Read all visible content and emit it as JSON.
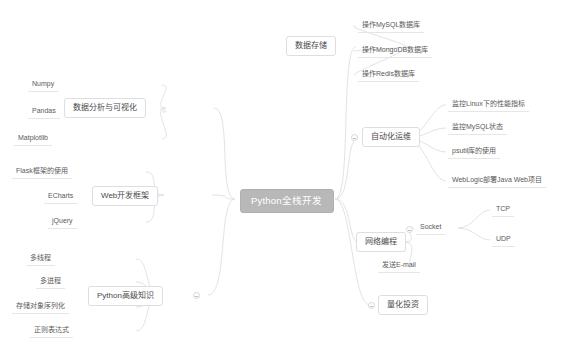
{
  "diagram": {
    "type": "mindmap",
    "title": "Python全栈开发",
    "background": "#ffffff",
    "root_fill": "#b8b8b8",
    "root_text_color": "#ffffff",
    "node_border": "#dedede",
    "edge_color": "#e3e3e3",
    "root": {
      "label": "Python全栈开发"
    },
    "branches": [
      {
        "id": "data-storage",
        "label": "数据存储",
        "side": "right",
        "children": [
          {
            "label": "操作MySQL数据库"
          },
          {
            "label": "操作MongoDB数据库"
          },
          {
            "label": "操作Redis数据库"
          }
        ]
      },
      {
        "id": "devops",
        "label": "自动化运维",
        "side": "right",
        "children": [
          {
            "label": "监控Linux下的性能指标"
          },
          {
            "label": "监控MySQL状态"
          },
          {
            "label": "psutil库的使用"
          },
          {
            "label": "WebLogic部署Java Web项目"
          }
        ]
      },
      {
        "id": "network",
        "label": "网络编程",
        "side": "right",
        "children": [
          {
            "label": "Socket",
            "has_toggle": true,
            "children": [
              {
                "label": "TCP"
              },
              {
                "label": "UDP"
              }
            ]
          },
          {
            "label": "发送E-mail"
          }
        ]
      },
      {
        "id": "quant",
        "label": "量化投资",
        "side": "right",
        "has_toggle": true,
        "children": []
      },
      {
        "id": "data-analysis",
        "label": "数据分析与可视化",
        "side": "left",
        "children": [
          {
            "label": "Numpy"
          },
          {
            "label": "Pandas"
          },
          {
            "label": "Matplotlib"
          }
        ]
      },
      {
        "id": "web",
        "label": "Web开发框架",
        "side": "left",
        "children": [
          {
            "label": "Flask框架的使用"
          },
          {
            "label": "ECharts"
          },
          {
            "label": "jQuery"
          }
        ]
      },
      {
        "id": "advanced",
        "label": "Python高级知识",
        "side": "left",
        "has_toggle": true,
        "children": [
          {
            "label": "多线程"
          },
          {
            "label": "多进程"
          },
          {
            "label": "存储对象序列化"
          },
          {
            "label": "正则表达式"
          }
        ]
      }
    ]
  }
}
